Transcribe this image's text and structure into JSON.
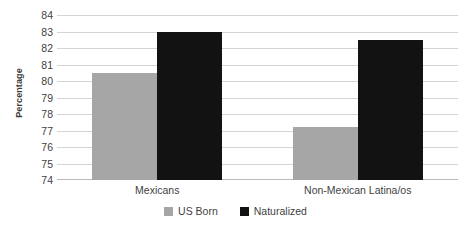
{
  "chart_data": {
    "type": "bar",
    "title": "",
    "xlabel": "",
    "ylabel": "Percentage",
    "ylim": [
      74,
      84
    ],
    "ytick_step": 1,
    "yticks": [
      "84",
      "83",
      "82",
      "81",
      "80",
      "79",
      "78",
      "77",
      "76",
      "75",
      "74"
    ],
    "grid": true,
    "legend_position": "bottom",
    "categories": [
      "Mexicans",
      "Non-Mexican Latina/os"
    ],
    "series": [
      {
        "name": "US Born",
        "color": "#a6a6a6",
        "values": [
          80.5,
          77.2
        ]
      },
      {
        "name": "Naturalized",
        "color": "#121212",
        "values": [
          83.0,
          82.5
        ]
      }
    ]
  },
  "axis": {
    "y_title": "Percentage"
  },
  "legend": {
    "items": [
      {
        "label": "US Born",
        "color": "#a6a6a6"
      },
      {
        "label": "Naturalized",
        "color": "#121212"
      }
    ]
  },
  "colors": {
    "us_born": "#a6a6a6",
    "naturalized": "#121212",
    "gridline": "#d4d4d4",
    "axis": "#b9b9b9",
    "text": "#3f3f3f",
    "background": "#ffffff"
  }
}
